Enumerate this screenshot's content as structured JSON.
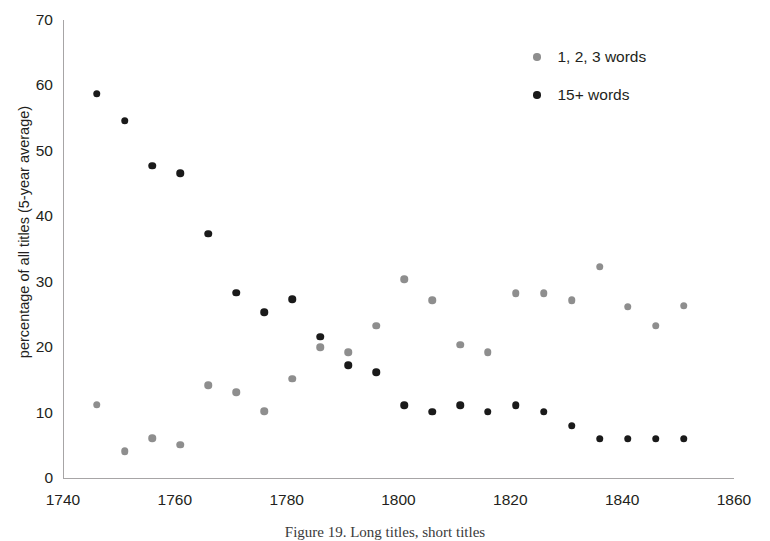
{
  "chart_data": {
    "type": "scatter",
    "title": "",
    "xlabel": "",
    "ylabel": "percentage of all titles (5-year average)",
    "xlim": [
      1740,
      1860
    ],
    "ylim": [
      0,
      70
    ],
    "xticks": [
      1740,
      1760,
      1780,
      1800,
      1820,
      1840,
      1860
    ],
    "yticks": [
      0,
      10,
      20,
      30,
      40,
      50,
      60,
      70
    ],
    "grid": false,
    "legend_position": "top-right",
    "series": [
      {
        "name": "1, 2, 3 words",
        "color": "#8e8e8e",
        "x": [
          1746,
          1751,
          1756,
          1761,
          1766,
          1771,
          1776,
          1781,
          1786,
          1791,
          1796,
          1801,
          1806,
          1811,
          1816,
          1821,
          1826,
          1831,
          1836,
          1841,
          1846,
          1851
        ],
        "y": [
          11.2,
          4.1,
          6.1,
          5.1,
          14.2,
          13.1,
          10.2,
          15.2,
          20.0,
          19.2,
          23.3,
          30.4,
          27.2,
          20.4,
          19.2,
          28.2,
          28.2,
          27.2,
          32.3,
          26.2,
          23.3,
          26.3
        ]
      },
      {
        "name": "15+ words",
        "color": "#1a1a1a",
        "x": [
          1746,
          1751,
          1756,
          1761,
          1766,
          1771,
          1776,
          1781,
          1786,
          1791,
          1796,
          1801,
          1806,
          1811,
          1816,
          1821,
          1826,
          1831,
          1836,
          1841,
          1846,
          1851
        ],
        "y": [
          58.7,
          54.6,
          47.7,
          46.6,
          37.3,
          28.3,
          25.3,
          27.3,
          21.6,
          17.2,
          16.2,
          11.1,
          10.1,
          11.1,
          10.1,
          11.1,
          10.1,
          8.0,
          6.0,
          6.0,
          6.0,
          6.0
        ]
      }
    ]
  },
  "legend": {
    "entries": [
      {
        "label": "1, 2, 3 words",
        "swatch": "gray"
      },
      {
        "label": "15+ words",
        "swatch": "black"
      }
    ]
  },
  "caption": {
    "text": "Figure 19. Long titles, short titles"
  },
  "colors": {
    "axis": "#a7a5a6",
    "text": "#231f20",
    "series_short": "#8e8e8e",
    "series_long": "#1a1a1a"
  }
}
